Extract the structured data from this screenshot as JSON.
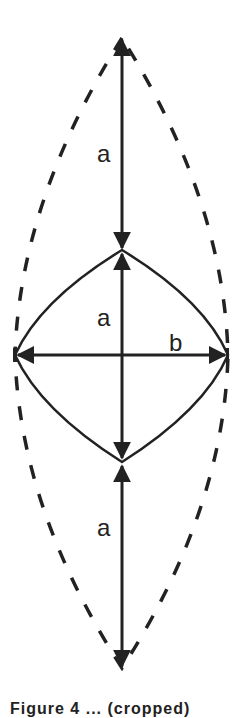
{
  "diagram": {
    "labels": {
      "upper_segment": "a",
      "middle_segment": "a",
      "horizontal_width": "b",
      "lower_segment": "a"
    },
    "caption": "Figure 4 ... (cropped)",
    "colors": {
      "stroke": "#222222",
      "background": "#ffffff"
    },
    "geometry": {
      "axis_x": 122,
      "top_tip_y": 38,
      "upper_vertex_y": 250,
      "center_y": 355,
      "lower_vertex_y": 462,
      "bottom_tip_y": 668,
      "left_x": 15,
      "right_x": 228
    }
  }
}
